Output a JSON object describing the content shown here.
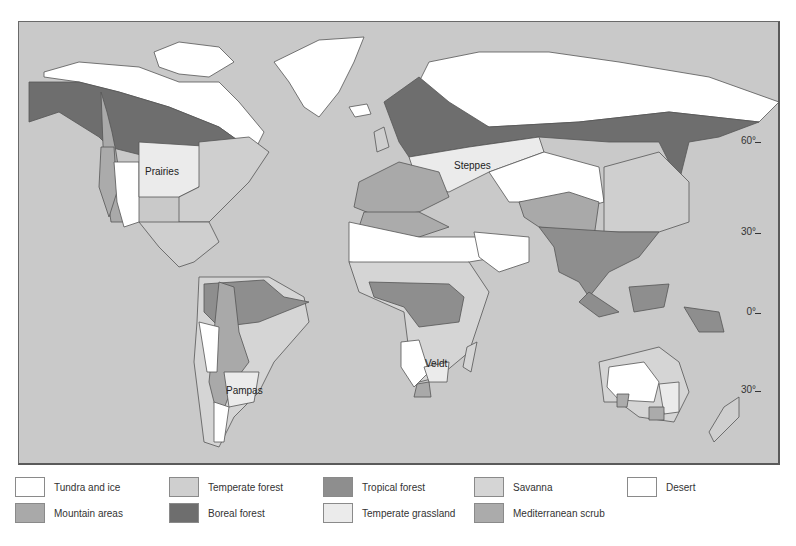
{
  "map": {
    "title": "World biomes map",
    "background_color": "#c9c9c9",
    "region_labels": {
      "prairies": "Prairies",
      "steppes": "Steppes",
      "pampas": "Pampas",
      "veldt": "Veldt"
    },
    "latitude_labels": {
      "lat60": "60°",
      "lat30n": "30°",
      "lat0": "0°",
      "lat30s": "30°"
    }
  },
  "legend": {
    "items": [
      {
        "label": "Tundra and ice",
        "color": "#ffffff"
      },
      {
        "label": "Mountain areas",
        "color": "#a9a9a9"
      },
      {
        "label": "Temperate forest",
        "color": "#cfcfcf"
      },
      {
        "label": "Boreal forest",
        "color": "#6e6e6e"
      },
      {
        "label": "Tropical forest",
        "color": "#8e8e8e"
      },
      {
        "label": "Temperate grassland",
        "color": "#ebebeb"
      },
      {
        "label": "Savanna",
        "color": "#d5d5d5"
      },
      {
        "label": "Mediterranean scrub",
        "color": "#ababab"
      },
      {
        "label": "Desert",
        "color": "#ffffff"
      }
    ]
  }
}
